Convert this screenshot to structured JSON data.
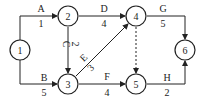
{
  "diagram": {
    "type": "activity-on-arrow network",
    "nodes": [
      {
        "id": "1",
        "label": "1",
        "x": 20,
        "y": 50
      },
      {
        "id": "2",
        "label": "2",
        "x": 68,
        "y": 16
      },
      {
        "id": "3",
        "label": "3",
        "x": 68,
        "y": 84
      },
      {
        "id": "4",
        "label": "4",
        "x": 136,
        "y": 16
      },
      {
        "id": "5",
        "label": "5",
        "x": 136,
        "y": 84
      },
      {
        "id": "6",
        "label": "6",
        "x": 185,
        "y": 50
      }
    ],
    "activities": [
      {
        "name": "A",
        "duration": "1",
        "from": "1",
        "to": "2"
      },
      {
        "name": "B",
        "duration": "5",
        "from": "1",
        "to": "3"
      },
      {
        "name": "C",
        "duration": "2",
        "from": "2",
        "to": "3"
      },
      {
        "name": "D",
        "duration": "4",
        "from": "2",
        "to": "4"
      },
      {
        "name": "E",
        "duration": "3",
        "from": "3",
        "to": "4"
      },
      {
        "name": "F",
        "duration": "4",
        "from": "3",
        "to": "5"
      },
      {
        "name": "G",
        "duration": "5",
        "from": "4",
        "to": "6"
      },
      {
        "name": "H",
        "duration": "2",
        "from": "5",
        "to": "6"
      },
      {
        "name": "dummy",
        "duration": "",
        "from": "4",
        "to": "5",
        "dashed": true
      }
    ]
  }
}
